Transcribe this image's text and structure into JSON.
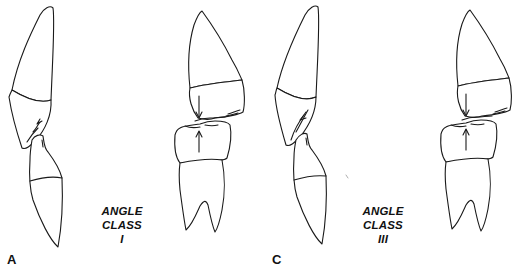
{
  "figure": {
    "panels": [
      {
        "letter": "A",
        "label_lines": [
          "ANGLE",
          "CLASS",
          "I"
        ],
        "description": "Incisor and molar relationship"
      },
      {
        "letter": "C",
        "label_lines": [
          "ANGLE",
          "CLASS",
          "III"
        ],
        "description": "Incisor and molar relationship"
      }
    ],
    "colors": {
      "line": "#1a1a1a",
      "background": "#ffffff"
    }
  }
}
